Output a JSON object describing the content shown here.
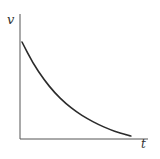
{
  "chart_data": {
    "type": "line",
    "title": "",
    "xlabel": "t",
    "ylabel": "v",
    "grid": false,
    "legend": null,
    "ticks": {
      "x": [],
      "y": []
    },
    "series": [
      {
        "name": "v(t)",
        "x": [
          0.0,
          0.1,
          0.2,
          0.3,
          0.4,
          0.5,
          0.6,
          0.7,
          0.8,
          0.9,
          1.0
        ],
        "values": [
          1.0,
          0.78,
          0.61,
          0.47,
          0.36,
          0.27,
          0.2,
          0.14,
          0.09,
          0.05,
          0.02
        ]
      }
    ],
    "xlim": [
      0,
      1.1
    ],
    "ylim": [
      0,
      1.3
    ]
  },
  "colors": {
    "axis": "#555555",
    "curve": "#2b2b2b",
    "background": "#ffffff"
  }
}
